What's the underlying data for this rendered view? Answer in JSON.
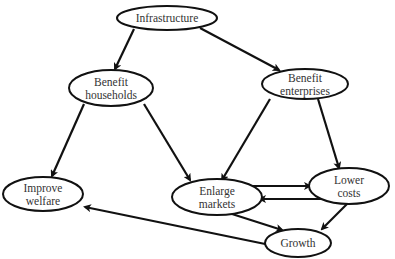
{
  "diagram": {
    "type": "causal-flow",
    "nodes": [
      {
        "id": "infrastructure",
        "lines": [
          "Infrastructure"
        ],
        "cx": 167,
        "cy": 18,
        "rx": 50,
        "ry": 12
      },
      {
        "id": "benefit_households",
        "lines": [
          "Benefit",
          "households"
        ],
        "cx": 111,
        "cy": 88,
        "rx": 42,
        "ry": 18
      },
      {
        "id": "benefit_enterprises",
        "lines": [
          "Benefit",
          "enterprises"
        ],
        "cx": 305,
        "cy": 84,
        "rx": 43,
        "ry": 15
      },
      {
        "id": "improve_welfare",
        "lines": [
          "Improve",
          "welfare"
        ],
        "cx": 43,
        "cy": 194,
        "rx": 40,
        "ry": 17
      },
      {
        "id": "enlarge_markets",
        "lines": [
          "Enlarge",
          "markets"
        ],
        "cx": 217,
        "cy": 197,
        "rx": 45,
        "ry": 18
      },
      {
        "id": "lower_costs",
        "lines": [
          "Lower",
          "costs"
        ],
        "cx": 349,
        "cy": 186,
        "rx": 40,
        "ry": 18
      },
      {
        "id": "growth",
        "lines": [
          "Growth"
        ],
        "cx": 298,
        "cy": 243,
        "rx": 33,
        "ry": 14
      }
    ],
    "edges": [
      {
        "from": "infrastructure",
        "to": "benefit_households",
        "x1": 134,
        "y1": 29,
        "x2": 115,
        "y2": 69
      },
      {
        "from": "infrastructure",
        "to": "benefit_enterprises",
        "x1": 200,
        "y1": 28,
        "x2": 279,
        "y2": 70
      },
      {
        "from": "benefit_households",
        "to": "improve_welfare",
        "x1": 84,
        "y1": 104,
        "x2": 52,
        "y2": 176
      },
      {
        "from": "benefit_households",
        "to": "enlarge_markets",
        "x1": 144,
        "y1": 104,
        "x2": 190,
        "y2": 180
      },
      {
        "from": "benefit_enterprises",
        "to": "enlarge_markets",
        "x1": 270,
        "y1": 99,
        "x2": 222,
        "y2": 180
      },
      {
        "from": "benefit_enterprises",
        "to": "lower_costs",
        "x1": 318,
        "y1": 99,
        "x2": 339,
        "y2": 168
      },
      {
        "from": "enlarge_markets",
        "to": "lower_costs",
        "x1": 243,
        "y1": 186,
        "x2": 310,
        "y2": 186
      },
      {
        "from": "lower_costs",
        "to": "enlarge_markets",
        "x1": 334,
        "y1": 199,
        "x2": 260,
        "y2": 199
      },
      {
        "from": "enlarge_markets",
        "to": "growth",
        "x1": 232,
        "y1": 214,
        "x2": 282,
        "y2": 230
      },
      {
        "from": "lower_costs",
        "to": "growth",
        "x1": 348,
        "y1": 203,
        "x2": 322,
        "y2": 229
      },
      {
        "from": "growth",
        "to": "improve_welfare",
        "x1": 270,
        "y1": 245,
        "x2": 85,
        "y2": 207
      }
    ]
  },
  "colors": {
    "background": "#ffffff",
    "stroke": "#111111",
    "text": "#333333"
  }
}
